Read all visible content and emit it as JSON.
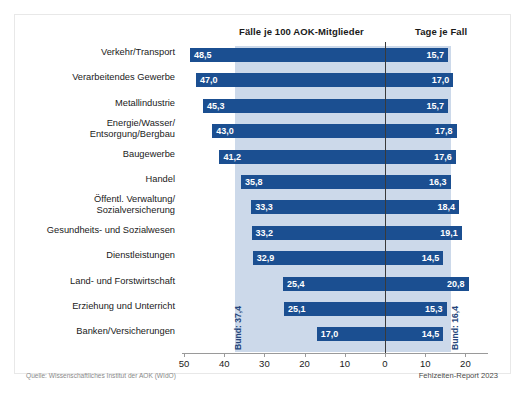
{
  "header": {
    "left_title": "Fälle je 100 AOK-Mitglieder",
    "right_title": "Tage je Fall"
  },
  "footer": {
    "source": "Quelle: Wissenschaftliches Institut der AOK (WIdO)",
    "credit": "Fehlzeiten-Report 2023"
  },
  "annotations": {
    "bund_left": "Bund: 37,4",
    "bund_right": "Bund: 16,4"
  },
  "chart_data": {
    "type": "bar",
    "subtitle": "",
    "orientation": "horizontal",
    "layout": "diverging-two-panel",
    "grid": false,
    "legend": null,
    "xlabel": "",
    "ylabel": "",
    "categories": [
      "Verkehr/Transport",
      "Verarbeitendes Gewerbe",
      "Metallindustrie",
      "Energie/Wasser/\nEntsorgung/Bergbau",
      "Baugewerbe",
      "Handel",
      "Öffentl. Verwaltung/\nSozialversicherung",
      "Gesundheits- und Sozialwesen",
      "Dienstleistungen",
      "Land- und Forstwirtschaft",
      "Erziehung und Unterricht",
      "Banken/Versicherungen"
    ],
    "series": [
      {
        "name": "Fälle je 100 AOK-Mitglieder",
        "side": "left",
        "axis_range": [
          0,
          50
        ],
        "axis_ticks": [
          50,
          40,
          30,
          20,
          10,
          0
        ],
        "reference_line": 37.4,
        "reference_label": "Bund: 37,4",
        "values": [
          48.5,
          47.0,
          45.3,
          43.0,
          41.2,
          35.8,
          33.3,
          33.2,
          32.9,
          25.4,
          25.1,
          17.0
        ],
        "labels": [
          "48,5",
          "47,0",
          "45,3",
          "43,0",
          "41,2",
          "35,8",
          "33,3",
          "33,2",
          "32,9",
          "25,4",
          "25,1",
          "17,0"
        ]
      },
      {
        "name": "Tage je Fall",
        "side": "right",
        "axis_range": [
          0,
          22
        ],
        "axis_ticks": [
          0,
          10,
          20
        ],
        "reference_line": 16.4,
        "reference_label": "Bund: 16,4",
        "values": [
          15.7,
          17.0,
          15.7,
          17.8,
          17.6,
          16.3,
          18.4,
          19.1,
          14.5,
          20.8,
          15.3,
          14.5
        ],
        "labels": [
          "15,7",
          "17,0",
          "15,7",
          "17,8",
          "17,6",
          "16,3",
          "18,4",
          "19,1",
          "14,5",
          "20,8",
          "15,3",
          "14,5"
        ]
      }
    ],
    "axis_tick_labels": [
      "50",
      "40",
      "30",
      "20",
      "10",
      "0",
      "10",
      "20"
    ],
    "colors": {
      "bar": "#1b4f91",
      "band": "#ccd9ea",
      "zero_line": "#3a3a3a",
      "value_text": "#ffffff",
      "category_text": "#1a1a1a"
    }
  }
}
